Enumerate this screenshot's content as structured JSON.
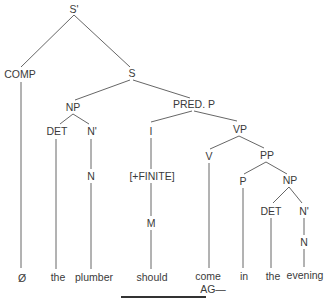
{
  "diagram": {
    "type": "syntax-tree",
    "nodes": {
      "s_bar": "S'",
      "comp": "COMP",
      "s": "S",
      "np_subj": "NP",
      "pred_p": "PRED. P",
      "det_subj": "DET",
      "nbar_subj": "N'",
      "i": "I",
      "vp": "VP",
      "n_subj": "N",
      "finite": "[+FINITE]",
      "v": "V",
      "pp": "PP",
      "p": "P",
      "np_obj": "NP",
      "det_obj": "DET",
      "nbar_obj": "N'",
      "m": "M",
      "n_obj": "N"
    },
    "leaves": [
      "Ø",
      "the",
      "plumber",
      "should",
      "come",
      "in",
      "the",
      "evening"
    ],
    "annotation": "AG—",
    "colors": {
      "line": "#555555",
      "text": "#3a3a3a",
      "background": "#ffffff",
      "underline": "#333333"
    }
  }
}
